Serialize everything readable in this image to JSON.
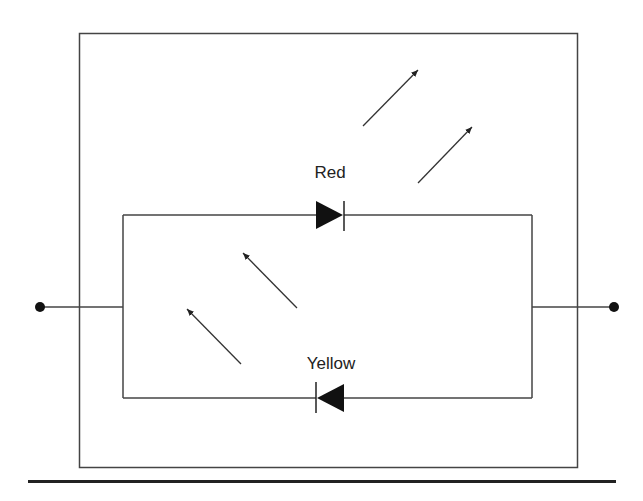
{
  "diagram": {
    "type": "circuit",
    "labels": {
      "red_led": "Red",
      "yellow_led": "Yellow"
    },
    "components": [
      {
        "id": "led-red",
        "type": "diode",
        "label": "Red",
        "direction": "right",
        "branch": "top"
      },
      {
        "id": "led-yellow",
        "type": "diode",
        "label": "Yellow",
        "direction": "left",
        "branch": "bottom"
      }
    ],
    "light_arrows": [
      {
        "group": "red",
        "count": 2,
        "direction": "up-right"
      },
      {
        "group": "yellow",
        "count": 2,
        "direction": "up-left"
      }
    ],
    "terminals": 2,
    "colors": {
      "line": "#333333",
      "fill": "#111111",
      "background": "#ffffff"
    }
  }
}
